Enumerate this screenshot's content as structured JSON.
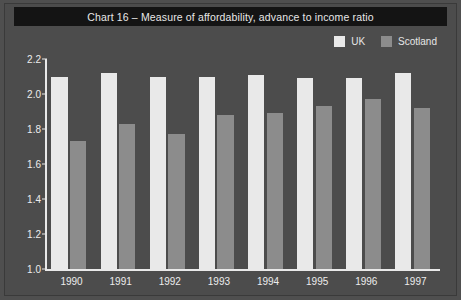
{
  "figure": {
    "title": "Chart 16 – Measure of affordability, advance to income ratio"
  },
  "colors": {
    "background": "#4c4c4c",
    "title_banner": "#141414",
    "axis": "#e9e9e9",
    "text": "#ededed",
    "uk": "#e9e9e9",
    "scotland": "#8c8c8c"
  },
  "legend": {
    "position": "top-right",
    "entries": [
      {
        "label": "UK",
        "color": "#e9e9e9"
      },
      {
        "label": "Scotland",
        "color": "#8c8c8c"
      }
    ]
  },
  "chart_data": {
    "type": "bar",
    "title": "Chart 16 – Measure of affordability, advance to income ratio",
    "xlabel": "",
    "ylabel": "",
    "categories": [
      "1990",
      "1991",
      "1992",
      "1993",
      "1994",
      "1995",
      "1996",
      "1997"
    ],
    "series": [
      {
        "name": "UK",
        "color": "#e9e9e9",
        "values": [
          2.1,
          2.12,
          2.1,
          2.1,
          2.11,
          2.09,
          2.09,
          2.12
        ]
      },
      {
        "name": "Scotland",
        "color": "#8c8c8c",
        "values": [
          1.73,
          1.83,
          1.77,
          1.88,
          1.89,
          1.93,
          1.97,
          1.92
        ]
      }
    ],
    "ylim": [
      1.0,
      2.2
    ],
    "yticks": [
      "1.0",
      "1.2",
      "1.4",
      "1.6",
      "1.8",
      "2.0",
      "2.2"
    ],
    "ytick_values": [
      1.0,
      1.2,
      1.4,
      1.6,
      1.8,
      2.0,
      2.2
    ],
    "grid": false,
    "legend_position": "top-right"
  }
}
